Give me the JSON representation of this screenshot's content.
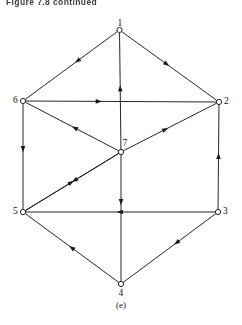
{
  "page": {
    "header_title": "Figure 7.8 continued",
    "caption": "(e)",
    "background_color": "#ffffff",
    "ink_color": "#1a1a1a"
  },
  "diagram": {
    "type": "directed-graph",
    "node_radius": 2.6,
    "nodes": [
      {
        "id": "1",
        "label": "1",
        "x": 119.5,
        "y": 30.0,
        "label_dx": -2.0,
        "label_dy": -11.5
      },
      {
        "id": "2",
        "label": "2",
        "x": 219.0,
        "y": 102.0,
        "label_dx": 5.0,
        "label_dy": -5.0
      },
      {
        "id": "3",
        "label": "3",
        "x": 218.0,
        "y": 212.0,
        "label_dx": 5.0,
        "label_dy": -5.0
      },
      {
        "id": "4",
        "label": "4",
        "x": 121.0,
        "y": 284.0,
        "label_dx": -2.5,
        "label_dy": 4.5
      },
      {
        "id": "5",
        "label": "5",
        "x": 23.0,
        "y": 212.0,
        "label_dx": -10.0,
        "label_dy": -5.0
      },
      {
        "id": "6",
        "label": "6",
        "x": 23.0,
        "y": 101.0,
        "label_dx": -10.0,
        "label_dy": -5.0
      },
      {
        "id": "7",
        "label": "7",
        "x": 121.0,
        "y": 152.0,
        "label_dx": 1.5,
        "label_dy": -13.0
      }
    ],
    "edges": [
      {
        "from": "1",
        "to": "6",
        "arrow_t": 0.46
      },
      {
        "from": "1",
        "to": "2",
        "arrow_t": 0.5
      },
      {
        "from": "7",
        "to": "1",
        "arrow_t": 0.55
      },
      {
        "from": "6",
        "to": "2",
        "arrow_t": 0.4
      },
      {
        "from": "6",
        "to": "5",
        "arrow_t": 0.46
      },
      {
        "from": "3",
        "to": "2",
        "arrow_t": 0.54
      },
      {
        "from": "5",
        "to": "7",
        "arrow_t": 0.52
      },
      {
        "from": "7",
        "to": "2",
        "arrow_t": 0.48
      },
      {
        "from": "7",
        "to": "6",
        "arrow_t": 0.5
      },
      {
        "from": "7",
        "to": "5",
        "arrow_t": 0.5
      },
      {
        "from": "7",
        "to": "4",
        "arrow_t": 0.4
      },
      {
        "from": "3",
        "to": "5",
        "arrow_t": 0.52
      },
      {
        "from": "4",
        "to": "5",
        "arrow_t": 0.53
      },
      {
        "from": "3",
        "to": "4",
        "arrow_t": 0.45
      }
    ]
  }
}
